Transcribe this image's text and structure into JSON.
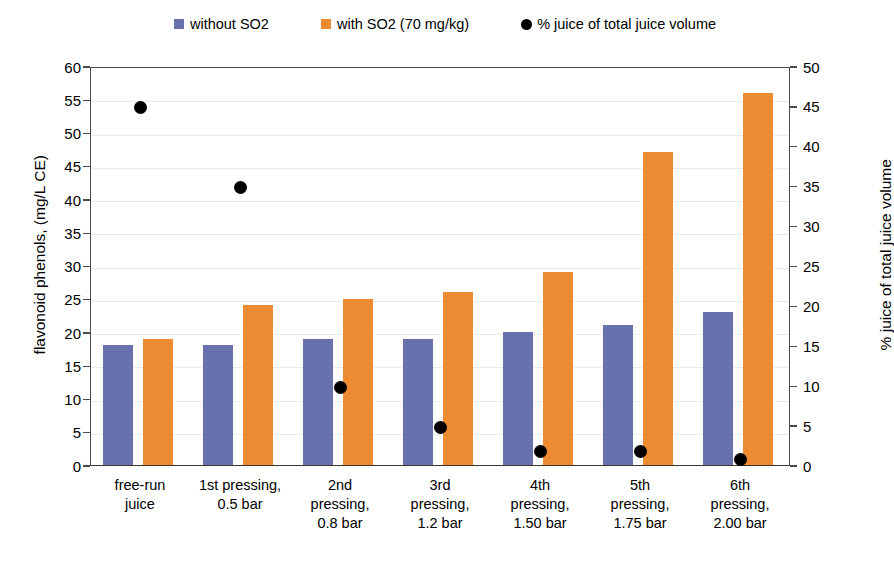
{
  "chart_data": {
    "type": "bar",
    "title": "",
    "xlabel": "",
    "ylabel": "flavonoid phenols, (mg/L CE)",
    "y2label": "% juice of total juice volume",
    "ylim": [
      0,
      60
    ],
    "y2lim": [
      0,
      50
    ],
    "yticks": [
      0,
      5,
      10,
      15,
      20,
      25,
      30,
      35,
      40,
      45,
      50,
      55,
      60
    ],
    "y2ticks": [
      0,
      5,
      10,
      15,
      20,
      25,
      30,
      35,
      40,
      45,
      50
    ],
    "grid": true,
    "legend_position": "top",
    "categories": [
      "free-run juice",
      "1st pressing, 0.5 bar",
      "2nd pressing, 0.8 bar",
      "3rd pressing, 1.2 bar",
      "4th pressing, 1.50 bar",
      "5th pressing, 1.75 bar",
      "6th pressing, 2.00 bar"
    ],
    "category_lines": [
      [
        "free-run",
        "juice"
      ],
      [
        "1st pressing,",
        "0.5 bar"
      ],
      [
        "2nd",
        "pressing,",
        "0.8 bar"
      ],
      [
        "3rd",
        "pressing,",
        "1.2 bar"
      ],
      [
        "4th",
        "pressing,",
        "1.50 bar"
      ],
      [
        "5th",
        "pressing,",
        "1.75 bar"
      ],
      [
        "6th",
        "pressing,",
        "2.00 bar"
      ]
    ],
    "series": [
      {
        "name": "without SO2",
        "type": "bar",
        "axis": "left",
        "color": "#6671AD",
        "values": [
          18,
          18,
          19,
          19,
          20,
          21,
          23
        ]
      },
      {
        "name": "with SO2 (70 mg/kg)",
        "type": "bar",
        "axis": "left",
        "color": "#ED8B32",
        "values": [
          19,
          24,
          25,
          26,
          29,
          47,
          56
        ]
      },
      {
        "name": "% juice of total juice volume",
        "type": "scatter",
        "axis": "right",
        "color": "#000000",
        "values": [
          45,
          35,
          10,
          5,
          2,
          2,
          1
        ]
      }
    ]
  },
  "legend": {
    "items": [
      {
        "label": "without SO2",
        "marker": "square-swatch-icon",
        "color": "#6671AD"
      },
      {
        "label": "with SO2 (70 mg/kg)",
        "marker": "square-swatch-icon",
        "color": "#ED8B32"
      },
      {
        "label": "% juice of total juice volume",
        "marker": "circle-marker-icon",
        "color": "#000000"
      }
    ]
  },
  "axes": {
    "left": {
      "title": "flavonoid phenols, (mg/L CE)",
      "ticks": [
        "0",
        "5",
        "10",
        "15",
        "20",
        "25",
        "30",
        "35",
        "40",
        "45",
        "50",
        "55",
        "60"
      ]
    },
    "right": {
      "title": "% juice of total juice volume",
      "ticks": [
        "0",
        "5",
        "10",
        "15",
        "20",
        "25",
        "30",
        "35",
        "40",
        "45",
        "50"
      ]
    }
  }
}
